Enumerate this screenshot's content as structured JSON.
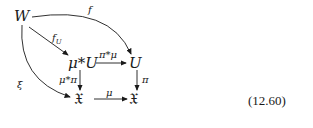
{
  "diagram": {
    "nodes": {
      "W": "W",
      "muU": "μ*U",
      "U": "U",
      "Zleft": "𝔛",
      "Xright": "𝔛"
    },
    "arrows": {
      "f": "f",
      "fU": "f",
      "fU_sub": "U",
      "pimu": "π*μ",
      "mupi": "μ*π",
      "pi": "π",
      "mu": "μ",
      "xi": "ξ"
    },
    "equation_number": "(12.60)",
    "colors": {
      "ink": "#1a1a1a",
      "background": "#ffffff"
    }
  }
}
